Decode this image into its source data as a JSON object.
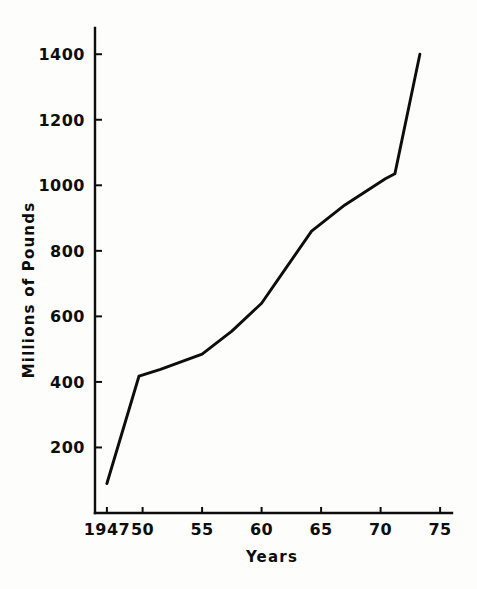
{
  "chart_data": {
    "type": "line",
    "title": "",
    "xlabel": "Years",
    "ylabel": "Millions of Pounds",
    "xlim": [
      1946,
      1976
    ],
    "ylim": [
      0,
      1480
    ],
    "grid": false,
    "legend": false,
    "x_tick_labels": [
      "1947",
      "50",
      "55",
      "60",
      "65",
      "70",
      "75"
    ],
    "x_tick_values": [
      1947,
      1950,
      1955,
      1960,
      1965,
      1970,
      1975
    ],
    "y_tick_labels": [
      "200",
      "400",
      "600",
      "800",
      "1000",
      "1200",
      "1400"
    ],
    "y_tick_values": [
      200,
      400,
      600,
      800,
      1000,
      1200,
      1400
    ],
    "series": [
      {
        "name": "Millions of Pounds",
        "color": "#0d0d0d",
        "x": [
          1947.0,
          1949.7,
          1951.5,
          1955.0,
          1957.5,
          1960.0,
          1962.0,
          1964.2,
          1967.0,
          1970.4,
          1971.2,
          1973.3
        ],
        "values": [
          90,
          418,
          438,
          485,
          555,
          640,
          745,
          860,
          940,
          1020,
          1035,
          1400
        ]
      }
    ]
  },
  "axes": {
    "y_title": "Millions of Pounds",
    "x_title": "Years"
  },
  "ticks": {
    "x": [
      {
        "label": "1947",
        "value": 1947
      },
      {
        "label": "50",
        "value": 1950
      },
      {
        "label": "55",
        "value": 1955
      },
      {
        "label": "60",
        "value": 1960
      },
      {
        "label": "65",
        "value": 1965
      },
      {
        "label": "70",
        "value": 1970
      },
      {
        "label": "75",
        "value": 1975
      }
    ],
    "y": [
      {
        "label": "200",
        "value": 200
      },
      {
        "label": "400",
        "value": 400
      },
      {
        "label": "600",
        "value": 600
      },
      {
        "label": "800",
        "value": 800
      },
      {
        "label": "1000",
        "value": 1000
      },
      {
        "label": "1200",
        "value": 1200
      },
      {
        "label": "1400",
        "value": 1400
      }
    ]
  }
}
